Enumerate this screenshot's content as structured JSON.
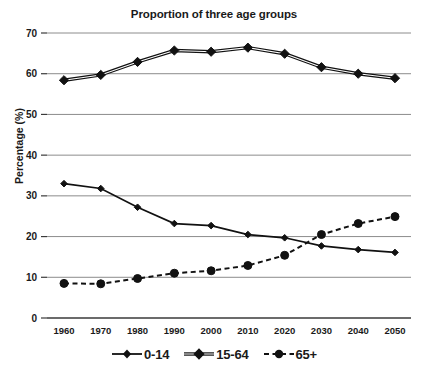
{
  "chart_data": {
    "type": "line",
    "title": "Proportion of three age groups",
    "xlabel": "",
    "ylabel": "Percentage (%)",
    "x": [
      1960,
      1970,
      1980,
      1990,
      2000,
      2010,
      2020,
      2030,
      2040,
      2050
    ],
    "xtick_labels": [
      "1960",
      "1970",
      "1980",
      "1990",
      "2000",
      "2010",
      "2020",
      "2030",
      "2040",
      "2050"
    ],
    "ytick_labels": [
      "0",
      "10",
      "20",
      "30",
      "40",
      "50",
      "60",
      "70"
    ],
    "yticks": [
      0,
      10,
      20,
      30,
      40,
      50,
      60,
      70
    ],
    "ylim": [
      0,
      70
    ],
    "grid": true,
    "legend_position": "bottom",
    "series": [
      {
        "name": "0-14",
        "style": "solid",
        "marker": "diamond-small",
        "color": "#111111",
        "values": [
          33.0,
          31.8,
          27.2,
          23.2,
          22.7,
          20.5,
          19.7,
          17.7,
          16.8,
          16.1
        ]
      },
      {
        "name": "15-64",
        "style": "solid-double",
        "marker": "diamond-large",
        "color": "#111111",
        "values": [
          58.4,
          59.7,
          62.9,
          65.7,
          65.4,
          66.4,
          64.9,
          61.6,
          60.0,
          58.9
        ]
      },
      {
        "name": "65+",
        "style": "dashed",
        "marker": "circle",
        "color": "#111111",
        "values": [
          8.5,
          8.4,
          9.7,
          11.0,
          11.6,
          12.9,
          15.4,
          20.5,
          23.2,
          24.9
        ]
      }
    ]
  },
  "legend": {
    "items": [
      {
        "label": "0-14"
      },
      {
        "label": "15-64"
      },
      {
        "label": "65+"
      }
    ]
  }
}
